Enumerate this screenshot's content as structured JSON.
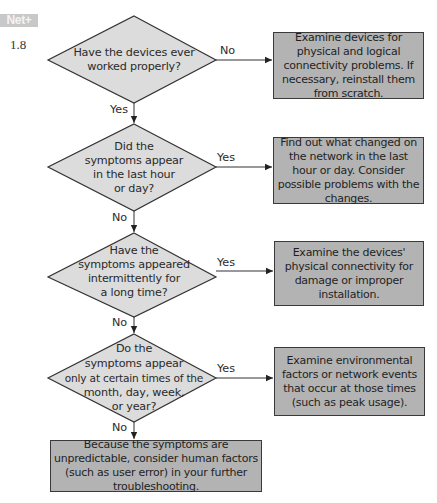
{
  "header": {
    "badge": "Net+",
    "section_number": "1.8"
  },
  "decisions": [
    {
      "id": "d1",
      "text_lines": [
        "Have the devices ever",
        "worked properly?"
      ],
      "yes_label": "Yes",
      "no_label": "No"
    },
    {
      "id": "d2",
      "text_lines": [
        "Did the",
        "symptoms appear",
        "in the last hour",
        "or day?"
      ],
      "yes_label": "Yes",
      "no_label": "No"
    },
    {
      "id": "d3",
      "text_lines": [
        "Have the",
        "symptoms appeared",
        "intermittently for",
        "a long time?"
      ],
      "yes_label": "Yes",
      "no_label": "No"
    },
    {
      "id": "d4",
      "text_lines": [
        "Do the",
        "symptoms appear",
        "only at certain times of the",
        "month, day, week,",
        "or year?"
      ],
      "yes_label": "Yes",
      "no_label": "No"
    }
  ],
  "actions": [
    {
      "id": "a1",
      "text": "Examine devices for physical and logical connectivity problems. If necessary, reinstall them from scratch."
    },
    {
      "id": "a2",
      "text": "Find out what changed on the network in the last hour or day. Consider possible problems with the changes."
    },
    {
      "id": "a3",
      "text": "Examine the devices' physical connectivity for damage or improper installation."
    },
    {
      "id": "a4",
      "text": "Examine environmental factors or network events that occur at those times (such as peak usage)."
    },
    {
      "id": "a5",
      "text": "Because the symptoms are unpredictable, consider human factors (such as user error) in your further troubleshooting."
    }
  ],
  "colors": {
    "diamond_fill": "#dcdcdc",
    "box_fill": "#b3b3b3",
    "stroke": "#333333",
    "badge_bg": "#c8c8c8"
  }
}
